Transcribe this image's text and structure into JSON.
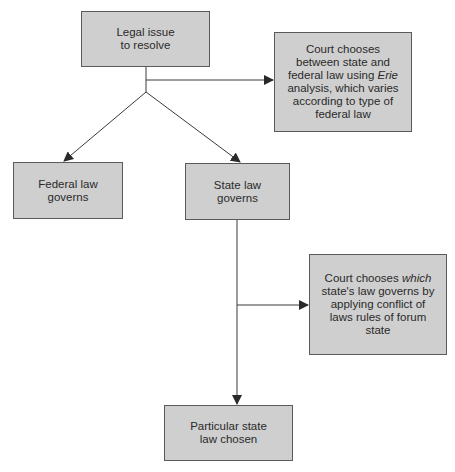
{
  "diagram": {
    "colors": {
      "box_fill": "#cfcfcf",
      "box_border": "#5a5a5a",
      "line": "#3a3a3a",
      "text": "#2a2a2a"
    },
    "nodes": {
      "legal_issue": {
        "line1": "Legal issue",
        "line2": "to resolve"
      },
      "erie_analysis": {
        "pre": "Court chooses between state and federal law using ",
        "italic": "Erie",
        "post": " analysis, which varies according to type of federal law"
      },
      "federal_law": {
        "line1": "Federal law",
        "line2": "governs"
      },
      "state_law": {
        "line1": "State law",
        "line2": "governs"
      },
      "conflict_of_laws": {
        "pre": "Court chooses ",
        "italic": "which",
        "post": " state's law governs by applying conflict of laws rules of forum state"
      },
      "particular_state": {
        "line1": "Particular state",
        "line2": "law chosen"
      }
    },
    "edges": [
      {
        "from": "legal_issue",
        "to": "erie_analysis"
      },
      {
        "from": "legal_issue",
        "to": "federal_law"
      },
      {
        "from": "legal_issue",
        "to": "state_law"
      },
      {
        "from": "state_law",
        "to": "conflict_of_laws"
      },
      {
        "from": "state_law",
        "to": "particular_state"
      }
    ]
  }
}
